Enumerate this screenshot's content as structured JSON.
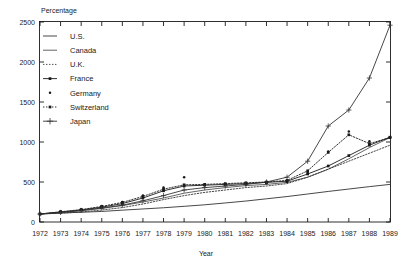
{
  "chart_data": {
    "type": "line",
    "title": "",
    "ylabel": "Percentage",
    "xlabel": "Year",
    "ylim": [
      0,
      2500
    ],
    "yticks": [
      0,
      500,
      1000,
      1500,
      2000,
      2500
    ],
    "ytick_labels": [
      "0",
      "500",
      "1000",
      "1500",
      "2000",
      "2500"
    ],
    "grid": false,
    "legend_position": "upper-left-inside",
    "categories": [
      1972,
      1973,
      1974,
      1975,
      1976,
      1977,
      1978,
      1979,
      1980,
      1981,
      1982,
      1983,
      1984,
      1985,
      1986,
      1987,
      1988,
      1989
    ],
    "xtick_labels": [
      "1972",
      "1973",
      "1974",
      "1975",
      "1976",
      "1977",
      "1978",
      "1979",
      "1980",
      "1981",
      "1982",
      "1983",
      "1984",
      "1985",
      "1986",
      "1987",
      "1988",
      "1989"
    ],
    "series": [
      {
        "name": "U.S.",
        "style": "solid-plain",
        "marker": "none",
        "color": "#333333",
        "values": [
          100,
          112,
          122,
          132,
          148,
          163,
          178,
          196,
          215,
          238,
          262,
          290,
          318,
          350,
          382,
          412,
          442,
          470
        ]
      },
      {
        "name": "Canada",
        "style": "solid-thin",
        "marker": "none",
        "color": "#333333",
        "values": [
          100,
          118,
          140,
          170,
          205,
          250,
          300,
          360,
          400,
          430,
          455,
          470,
          495,
          560,
          660,
          790,
          930,
          1055
        ]
      },
      {
        "name": "U.K.",
        "style": "dotted",
        "marker": "none",
        "color": "#333333",
        "values": [
          100,
          110,
          125,
          150,
          180,
          225,
          280,
          330,
          370,
          400,
          430,
          450,
          480,
          560,
          660,
          760,
          860,
          960
        ]
      },
      {
        "name": "France",
        "style": "solid-square",
        "marker": "square",
        "color": "#1a1a1a",
        "values": [
          100,
          125,
          150,
          185,
          230,
          300,
          390,
          450,
          460,
          470,
          480,
          495,
          510,
          600,
          700,
          830,
          960,
          1060
        ]
      },
      {
        "name": "Germany",
        "style": "dot-marker",
        "marker": "dot",
        "color": "#1a1a1a",
        "values": [
          100,
          130,
          160,
          200,
          250,
          330,
          430,
          560,
          470,
          470,
          470,
          485,
          500,
          620,
          880,
          1130,
          1010,
          1060
        ]
      },
      {
        "name": "Switzerland",
        "style": "dotted-square",
        "marker": "square",
        "color": "#1a1a1a",
        "values": [
          100,
          128,
          155,
          195,
          245,
          320,
          410,
          465,
          470,
          480,
          490,
          500,
          520,
          640,
          870,
          1090,
          980,
          1055
        ]
      },
      {
        "name": "Japan",
        "style": "solid-plus",
        "marker": "plus",
        "color": "#333333",
        "values": [
          100,
          120,
          145,
          175,
          210,
          265,
          330,
          400,
          430,
          450,
          470,
          500,
          560,
          760,
          1200,
          1400,
          1800,
          2460
        ]
      }
    ]
  },
  "legend": {
    "entries": [
      {
        "label": "U.S.",
        "key": "us"
      },
      {
        "label": "Canada",
        "key": "canada"
      },
      {
        "label": "U.K.",
        "key": "uk"
      },
      {
        "label": "France",
        "key": "france"
      },
      {
        "label": "Germany",
        "key": "germany"
      },
      {
        "label": "Switzerland",
        "key": "switzerland"
      },
      {
        "label": "Japan",
        "key": "japan"
      }
    ]
  },
  "axes": {
    "y_title": "Percentage",
    "x_title": "Year"
  }
}
